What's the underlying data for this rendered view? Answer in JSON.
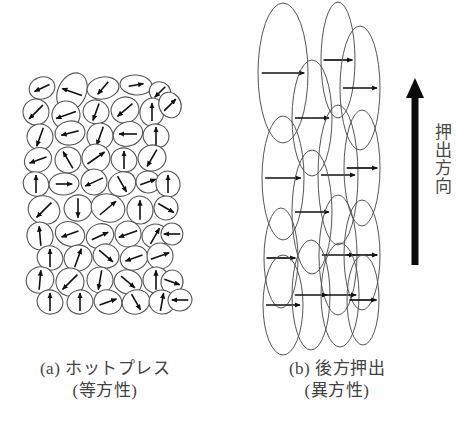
{
  "figure": {
    "background_color": "#ffffff",
    "ink_color": "#1a1a1a",
    "outline_color": "#555555",
    "panels": [
      {
        "id": "panel-a",
        "caption_line1": "(a) ホットプレス",
        "caption_line2": "(等方性)",
        "description": "randomly oriented grains"
      },
      {
        "id": "panel-b",
        "caption_line1": "(b) 後方押出",
        "caption_line2": "(異方性)",
        "description": "elongated grains aligned vertically"
      }
    ],
    "annotation": {
      "arrow_name": "extrusion-direction-arrow",
      "label": "押出方向"
    }
  },
  "chart_data": {
    "type": "diagram",
    "title": "",
    "panel_a": {
      "grain_shape": "ellipse",
      "grain_count": 62,
      "orientation": "random",
      "arrow_directions_deg": [
        205,
        160,
        230,
        10,
        225,
        20,
        195,
        250,
        220,
        45,
        335,
        250,
        85,
        345,
        90,
        260,
        180,
        120,
        35,
        90,
        240,
        90,
        45,
        200,
        115,
        260,
        200,
        90,
        35,
        110,
        300,
        90,
        80,
        0,
        205,
        300,
        20,
        10,
        85,
        225,
        240,
        55,
        90,
        215,
        270,
        340,
        40,
        35,
        330,
        95,
        200,
        355,
        60,
        200,
        170,
        250,
        20,
        95,
        320,
        285,
        85,
        45,
        55,
        70,
        215,
        25,
        60,
        200,
        90,
        215,
        345,
        260,
        180
      ],
      "grains": [
        {
          "cx": 42,
          "cy": 88,
          "rx": 13,
          "ry": 11,
          "rot": -20,
          "ang": 205
        },
        {
          "cx": 72,
          "cy": 92,
          "rx": 14,
          "ry": 20,
          "rot": 25,
          "ang": 160
        },
        {
          "cx": 103,
          "cy": 88,
          "rx": 16,
          "ry": 11,
          "rot": -10,
          "ang": 230
        },
        {
          "cx": 136,
          "cy": 85,
          "rx": 16,
          "ry": 10,
          "rot": 5,
          "ang": 10
        },
        {
          "cx": 160,
          "cy": 92,
          "rx": 11,
          "ry": 10,
          "rot": 30,
          "ang": 225
        },
        {
          "cx": 36,
          "cy": 112,
          "rx": 13,
          "ry": 13,
          "rot": 40,
          "ang": 225
        },
        {
          "cx": 66,
          "cy": 115,
          "rx": 14,
          "ry": 14,
          "rot": -25,
          "ang": 200
        },
        {
          "cx": 96,
          "cy": 112,
          "rx": 13,
          "ry": 12,
          "rot": 15,
          "ang": 250
        },
        {
          "cx": 125,
          "cy": 110,
          "rx": 14,
          "ry": 13,
          "rot": -15,
          "ang": 220
        },
        {
          "cx": 152,
          "cy": 112,
          "rx": 12,
          "ry": 14,
          "rot": 10,
          "ang": 90
        },
        {
          "cx": 170,
          "cy": 105,
          "rx": 11,
          "ry": 13,
          "rot": -20,
          "ang": 45
        },
        {
          "cx": 40,
          "cy": 137,
          "rx": 13,
          "ry": 13,
          "rot": 20,
          "ang": 250
        },
        {
          "cx": 70,
          "cy": 133,
          "rx": 15,
          "ry": 12,
          "rot": -10,
          "ang": 195
        },
        {
          "cx": 100,
          "cy": 136,
          "rx": 13,
          "ry": 13,
          "rot": 30,
          "ang": 250
        },
        {
          "cx": 128,
          "cy": 134,
          "rx": 15,
          "ry": 12,
          "rot": -20,
          "ang": 180
        },
        {
          "cx": 156,
          "cy": 136,
          "rx": 13,
          "ry": 12,
          "rot": 15,
          "ang": 90
        },
        {
          "cx": 38,
          "cy": 160,
          "rx": 14,
          "ry": 12,
          "rot": -30,
          "ang": 200
        },
        {
          "cx": 68,
          "cy": 160,
          "rx": 13,
          "ry": 13,
          "rot": 25,
          "ang": 120
        },
        {
          "cx": 96,
          "cy": 158,
          "rx": 14,
          "ry": 14,
          "rot": -10,
          "ang": 35
        },
        {
          "cx": 124,
          "cy": 160,
          "rx": 13,
          "ry": 12,
          "rot": 20,
          "ang": 90
        },
        {
          "cx": 152,
          "cy": 158,
          "rx": 14,
          "ry": 13,
          "rot": -15,
          "ang": 240
        },
        {
          "cx": 36,
          "cy": 184,
          "rx": 13,
          "ry": 12,
          "rot": 30,
          "ang": 90
        },
        {
          "cx": 64,
          "cy": 184,
          "rx": 15,
          "ry": 11,
          "rot": -5,
          "ang": 0
        },
        {
          "cx": 94,
          "cy": 182,
          "rx": 13,
          "ry": 13,
          "rot": 15,
          "ang": 205
        },
        {
          "cx": 122,
          "cy": 184,
          "rx": 14,
          "ry": 12,
          "rot": -25,
          "ang": 300
        },
        {
          "cx": 148,
          "cy": 182,
          "rx": 12,
          "ry": 11,
          "rot": 10,
          "ang": 20
        },
        {
          "cx": 168,
          "cy": 184,
          "rx": 12,
          "ry": 13,
          "rot": -15,
          "ang": 90
        },
        {
          "cx": 44,
          "cy": 210,
          "rx": 16,
          "ry": 14,
          "rot": 20,
          "ang": 225
        },
        {
          "cx": 78,
          "cy": 208,
          "rx": 14,
          "ry": 13,
          "rot": -20,
          "ang": 270
        },
        {
          "cx": 108,
          "cy": 208,
          "rx": 17,
          "ry": 14,
          "rot": 15,
          "ang": 40
        },
        {
          "cx": 140,
          "cy": 210,
          "rx": 13,
          "ry": 14,
          "rot": -10,
          "ang": 90
        },
        {
          "cx": 166,
          "cy": 208,
          "rx": 12,
          "ry": 12,
          "rot": 25,
          "ang": 330
        },
        {
          "cx": 40,
          "cy": 236,
          "rx": 13,
          "ry": 14,
          "rot": -15,
          "ang": 95
        },
        {
          "cx": 70,
          "cy": 234,
          "rx": 15,
          "ry": 12,
          "rot": 20,
          "ang": 200
        },
        {
          "cx": 100,
          "cy": 236,
          "rx": 14,
          "ry": 12,
          "rot": -25,
          "ang": 25
        },
        {
          "cx": 128,
          "cy": 234,
          "rx": 13,
          "ry": 13,
          "rot": 10,
          "ang": 200
        },
        {
          "cx": 155,
          "cy": 236,
          "rx": 13,
          "ry": 12,
          "rot": -10,
          "ang": 60
        },
        {
          "cx": 172,
          "cy": 234,
          "rx": 11,
          "ry": 11,
          "rot": 20,
          "ang": 180
        },
        {
          "cx": 50,
          "cy": 258,
          "rx": 13,
          "ry": 12,
          "rot": 25,
          "ang": 90
        },
        {
          "cx": 78,
          "cy": 258,
          "rx": 14,
          "ry": 13,
          "rot": -15,
          "ang": 70
        },
        {
          "cx": 106,
          "cy": 256,
          "rx": 13,
          "ry": 12,
          "rot": 15,
          "ang": 320
        },
        {
          "cx": 134,
          "cy": 258,
          "rx": 14,
          "ry": 12,
          "rot": -20,
          "ang": 200
        },
        {
          "cx": 160,
          "cy": 256,
          "rx": 13,
          "ry": 13,
          "rot": 10,
          "ang": 20
        },
        {
          "cx": 40,
          "cy": 280,
          "rx": 14,
          "ry": 13,
          "rot": -25,
          "ang": 85
        },
        {
          "cx": 70,
          "cy": 282,
          "rx": 14,
          "ry": 14,
          "rot": 20,
          "ang": 225
        },
        {
          "cx": 100,
          "cy": 280,
          "rx": 13,
          "ry": 13,
          "rot": -10,
          "ang": 260
        },
        {
          "cx": 128,
          "cy": 282,
          "rx": 14,
          "ry": 12,
          "rot": 15,
          "ang": 320
        },
        {
          "cx": 156,
          "cy": 280,
          "rx": 13,
          "ry": 13,
          "rot": -20,
          "ang": 90
        },
        {
          "cx": 172,
          "cy": 282,
          "rx": 11,
          "ry": 12,
          "rot": 10,
          "ang": 340
        },
        {
          "cx": 50,
          "cy": 302,
          "rx": 13,
          "ry": 12,
          "rot": 20,
          "ang": 90
        },
        {
          "cx": 80,
          "cy": 302,
          "rx": 13,
          "ry": 12,
          "rot": -15,
          "ang": 90
        },
        {
          "cx": 108,
          "cy": 302,
          "rx": 14,
          "ry": 12,
          "rot": 15,
          "ang": 20
        },
        {
          "cx": 136,
          "cy": 302,
          "rx": 14,
          "ry": 12,
          "rot": -20,
          "ang": 300
        },
        {
          "cx": 162,
          "cy": 302,
          "rx": 13,
          "ry": 12,
          "rot": 10,
          "ang": 80
        },
        {
          "cx": 180,
          "cy": 300,
          "rx": 12,
          "ry": 11,
          "rot": -10,
          "ang": 180
        }
      ]
    },
    "panel_b": {
      "grain_shape": "elongated ellipse",
      "grain_count": 15,
      "orientation": "aligned, long axis vertical (perpendicular to extrusion arrows)",
      "arrow_direction_deg": 0,
      "grains": [
        {
          "cx": 283,
          "cy": 73,
          "rx": 25,
          "ry": 70
        },
        {
          "cx": 338,
          "cy": 60,
          "rx": 17,
          "ry": 58
        },
        {
          "cx": 360,
          "cy": 88,
          "rx": 20,
          "ry": 62
        },
        {
          "cx": 312,
          "cy": 118,
          "rx": 20,
          "ry": 58
        },
        {
          "cx": 283,
          "cy": 178,
          "rx": 21,
          "ry": 62
        },
        {
          "cx": 338,
          "cy": 175,
          "rx": 20,
          "ry": 70
        },
        {
          "cx": 362,
          "cy": 168,
          "rx": 18,
          "ry": 58
        },
        {
          "cx": 312,
          "cy": 212,
          "rx": 20,
          "ry": 62
        },
        {
          "cx": 281,
          "cy": 258,
          "rx": 17,
          "ry": 50
        },
        {
          "cx": 338,
          "cy": 255,
          "rx": 19,
          "ry": 60
        },
        {
          "cx": 362,
          "cy": 255,
          "rx": 18,
          "ry": 55
        },
        {
          "cx": 283,
          "cy": 305,
          "rx": 20,
          "ry": 50
        },
        {
          "cx": 311,
          "cy": 295,
          "rx": 19,
          "ry": 55
        },
        {
          "cx": 340,
          "cy": 295,
          "rx": 19,
          "ry": 52
        },
        {
          "cx": 363,
          "cy": 300,
          "rx": 16,
          "ry": 45
        }
      ]
    }
  }
}
